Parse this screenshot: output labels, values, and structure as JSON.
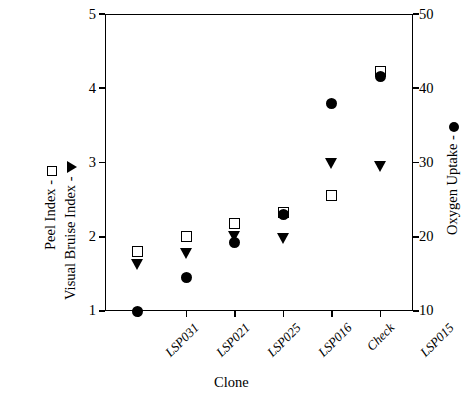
{
  "chart_data": {
    "type": "scatter",
    "title": "",
    "xlabel": "Clone",
    "categories": [
      "LSP031",
      "LSP021",
      "LSP025",
      "LSP016",
      "Check",
      "LSP015"
    ],
    "left_axis": {
      "label_peel": "Peel Index - ",
      "label_bruise": "Visual Bruise Index - ",
      "ylim": [
        1,
        5
      ],
      "ticks": [
        "1",
        "2",
        "3",
        "4",
        "5"
      ]
    },
    "right_axis": {
      "label": "Oxygen Uptake - ",
      "ylim": [
        10,
        50
      ],
      "ticks": [
        "10",
        "20",
        "30",
        "40",
        "50"
      ]
    },
    "series": [
      {
        "name": "Peel Index",
        "marker": "open-square",
        "axis": "left",
        "values": [
          1.8,
          2.0,
          2.18,
          2.33,
          2.55,
          4.22
        ]
      },
      {
        "name": "Visual Bruise Index",
        "marker": "filled-triangle-down",
        "axis": "left",
        "values": [
          1.62,
          1.78,
          2.0,
          1.98,
          2.98,
          2.95
        ]
      },
      {
        "name": "Oxygen Uptake",
        "marker": "filled-circle",
        "axis": "right",
        "values": [
          10.0,
          14.5,
          19.2,
          23.0,
          38.0,
          41.6
        ]
      }
    ],
    "grid": false,
    "legend_position": "axis-titles"
  },
  "colors": {
    "foreground": "#000000",
    "background": "#ffffff"
  }
}
